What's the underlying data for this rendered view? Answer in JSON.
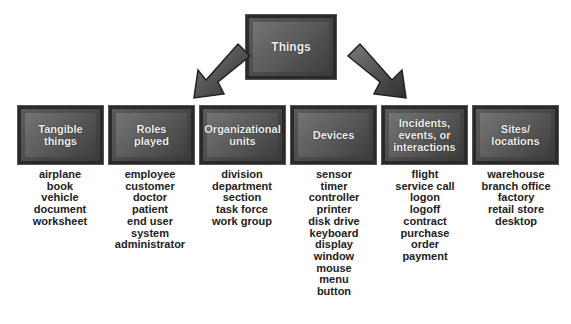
{
  "diagram": {
    "root": {
      "label": "Things"
    },
    "arrows": [
      {
        "direction": "down-left",
        "from": "Things"
      },
      {
        "direction": "down-right",
        "from": "Things"
      }
    ],
    "categories": [
      {
        "label": "Tangible\nthings",
        "examples": [
          "airplane",
          "book",
          "vehicle",
          "document",
          "worksheet"
        ]
      },
      {
        "label": "Roles\nplayed",
        "examples": [
          "employee",
          "customer",
          "doctor",
          "patient",
          "end user",
          "system",
          "administrator"
        ]
      },
      {
        "label": "Organizational\nunits",
        "examples": [
          "division",
          "department",
          "section",
          "task force",
          "work group"
        ]
      },
      {
        "label": "Devices",
        "examples": [
          "sensor",
          "timer",
          "controller",
          "printer",
          "disk drive",
          "keyboard",
          "display",
          "window",
          "mouse",
          "menu",
          "button"
        ]
      },
      {
        "label": "Incidents,\nevents, or\ninteractions",
        "examples": [
          "flight",
          "service call",
          "logon",
          "logoff",
          "contract",
          "purchase",
          "order",
          "payment"
        ]
      },
      {
        "label": "Sites/\nlocations",
        "examples": [
          "warehouse",
          "branch office",
          "factory",
          "retail store",
          "desktop"
        ]
      }
    ]
  }
}
